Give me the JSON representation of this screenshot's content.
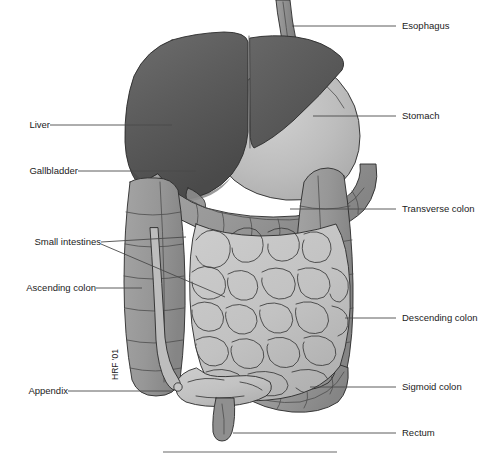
{
  "figure": {
    "signature": "HRF '01",
    "background_color": "#ffffff"
  },
  "palette": {
    "liver": "#5e5e5e",
    "liver_dark": "#4b4b4b",
    "liver_highlight": "#6f6f6f",
    "stomach": "#b8b8b8",
    "stomach_highlight": "#cfcfcf",
    "colon": "#999999",
    "colon_shadow": "#848484",
    "small_intestine": "#c5c5c5",
    "small_intestine_shadow": "#b0b0b0",
    "esophagus": "#8f8f8f",
    "outline": "#2a2a2a",
    "leader_line": "#4a4a4a",
    "label_text": "#1b1b1b",
    "bottom_rule": "#9a9a9a"
  },
  "labels": {
    "left": [
      {
        "id": "liver",
        "text": "Liver",
        "x": 44,
        "y": 128,
        "leader": "M 50 125 L 172 125"
      },
      {
        "id": "gallbladder",
        "text": "Gallbladder",
        "x": 72,
        "y": 174,
        "leader": "M 78 171 L 196 171"
      },
      {
        "id": "small-intestines",
        "text": "Small intestines",
        "x": 97,
        "y": 245,
        "leader": "M 101 242 L 186 237 M 101 244 L 225 297"
      },
      {
        "id": "ascending-colon",
        "text": "Ascending colon",
        "x": 92,
        "y": 291,
        "leader": "M 96 288 L 142 288"
      },
      {
        "id": "appendix",
        "text": "Appendix",
        "x": 62,
        "y": 394,
        "leader": "M 68 391 L 173 391"
      }
    ],
    "right": [
      {
        "id": "esophagus",
        "text": "Esophagus",
        "x": 402,
        "y": 29,
        "leader": "M 396 26 L 292 26"
      },
      {
        "id": "stomach",
        "text": "Stomach",
        "x": 402,
        "y": 119,
        "leader": "M 396 116 L 313 116"
      },
      {
        "id": "transverse-colon",
        "text": "Transverse colon",
        "x": 402,
        "y": 212,
        "leader": "M 396 209 L 290 209"
      },
      {
        "id": "descending-colon",
        "text": "Descending colon",
        "x": 402,
        "y": 321,
        "leader": "M 396 318 L 345 318"
      },
      {
        "id": "sigmoid-colon",
        "text": "Sigmoid colon",
        "x": 402,
        "y": 390,
        "leader": "M 396 387 L 310 387"
      },
      {
        "id": "rectum",
        "text": "Rectum",
        "x": 402,
        "y": 436,
        "leader": "M 396 433 L 233 433"
      }
    ]
  },
  "organs": [
    {
      "id": "esophagus",
      "name": "Esophagus"
    },
    {
      "id": "liver",
      "name": "Liver"
    },
    {
      "id": "gallbladder",
      "name": "Gallbladder"
    },
    {
      "id": "stomach",
      "name": "Stomach"
    },
    {
      "id": "transverse-colon",
      "name": "Transverse colon"
    },
    {
      "id": "ascending-colon",
      "name": "Ascending colon"
    },
    {
      "id": "descending-colon",
      "name": "Descending colon"
    },
    {
      "id": "sigmoid-colon",
      "name": "Sigmoid colon"
    },
    {
      "id": "small-intestines",
      "name": "Small intestines"
    },
    {
      "id": "appendix",
      "name": "Appendix"
    },
    {
      "id": "rectum",
      "name": "Rectum"
    }
  ],
  "bottom_rule": {
    "x1": 163,
    "x2": 337,
    "y": 452
  }
}
